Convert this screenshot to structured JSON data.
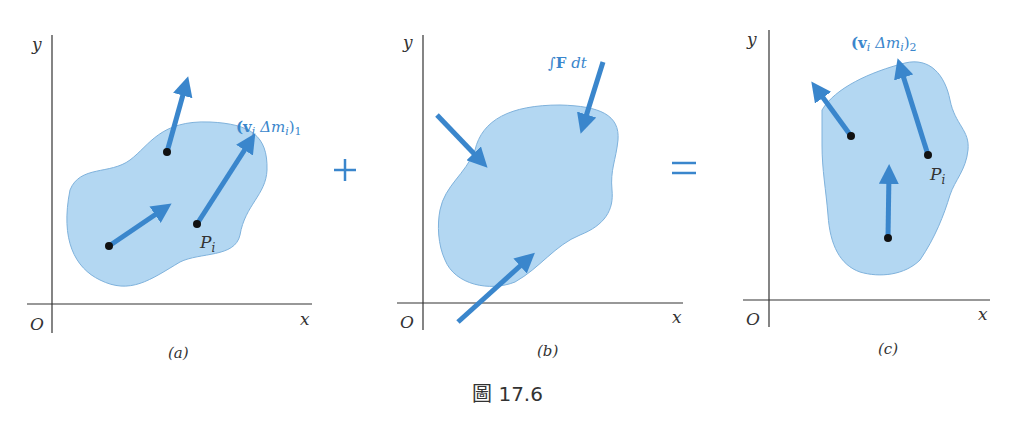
{
  "figure": {
    "caption": "圖 17.6",
    "operators": {
      "plus": "+",
      "equals": "="
    },
    "colors": {
      "blob_fill": "#b3d7f2",
      "arrow": "#3a86cc",
      "axis": "#333333",
      "label_blue": "#3a86cc"
    },
    "panels": [
      {
        "id": "a",
        "sublabel": "(a)",
        "axis_labels": {
          "y": "y",
          "x": "x",
          "origin": "O"
        },
        "point_label": "P",
        "point_label_sub": "i",
        "vector_label": "(v",
        "vector_label_full": "(vᵢ Δmᵢ)₁",
        "vector_label_parts": {
          "v": "(v",
          "vi": "i",
          "dm": " Δm",
          "dmi": "i",
          "close": ")",
          "subscript": "1"
        }
      },
      {
        "id": "b",
        "sublabel": "(b)",
        "axis_labels": {
          "y": "y",
          "x": "x",
          "origin": "O"
        },
        "impulse_label": "∫F dt",
        "impulse_parts": {
          "int": "∫",
          "F": "F",
          "dt": " dt"
        }
      },
      {
        "id": "c",
        "sublabel": "(c)",
        "axis_labels": {
          "y": "y",
          "x": "x",
          "origin": "O"
        },
        "point_label": "P",
        "point_label_sub": "i",
        "vector_label_full": "(vᵢ Δmᵢ)₂",
        "vector_label_parts": {
          "v": "(v",
          "vi": "i",
          "dm": " Δm",
          "dmi": "i",
          "close": ")",
          "subscript": "2"
        }
      }
    ]
  }
}
